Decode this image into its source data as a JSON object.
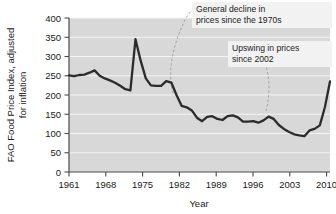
{
  "chart_data": {
    "type": "line",
    "title": "",
    "xlabel": "Year",
    "ylabel": "FAO Food Price Index, adjusted for inflation",
    "ylabel_line1": "FAO Food Price Index, adjusted",
    "ylabel_line2": "for inflation",
    "xlim": [
      1961,
      2012
    ],
    "ylim": [
      0,
      400
    ],
    "xticks": [
      1961,
      1968,
      1975,
      1982,
      1989,
      1996,
      2003,
      2010
    ],
    "xtick_labels": [
      "1961",
      "1968",
      "1975",
      "1982",
      "1989",
      "1996",
      "2003",
      "2010"
    ],
    "yticks": [
      0,
      50,
      100,
      150,
      200,
      250,
      300,
      350,
      400
    ],
    "ytick_labels": [
      "0",
      "50",
      "100",
      "150",
      "200",
      "250",
      "300",
      "350",
      "400"
    ],
    "grid": "horizontal",
    "legend": "none",
    "series": [
      {
        "name": "FAO Food Price Index (real)",
        "color": "#2b2b2b",
        "x": [
          1961,
          1962,
          1963,
          1964,
          1965,
          1966,
          1967,
          1968,
          1969,
          1970,
          1971,
          1972,
          1973,
          1974,
          1975,
          1976,
          1977,
          1978,
          1979,
          1980,
          1981,
          1982,
          1983,
          1984,
          1985,
          1986,
          1987,
          1988,
          1989,
          1990,
          1991,
          1992,
          1993,
          1994,
          1995,
          1996,
          1997,
          1998,
          1999,
          2000,
          2001,
          2002,
          2003,
          2004,
          2005,
          2006,
          2007,
          2008,
          2009,
          2010,
          2011,
          2012
        ],
        "values": [
          251,
          249,
          252,
          253,
          258,
          264,
          250,
          243,
          238,
          232,
          224,
          215,
          212,
          345,
          290,
          243,
          225,
          224,
          224,
          236,
          232,
          200,
          172,
          168,
          160,
          141,
          132,
          143,
          145,
          138,
          135,
          145,
          147,
          142,
          131,
          131,
          132,
          128,
          134,
          144,
          138,
          122,
          112,
          104,
          98,
          95,
          93,
          108,
          112,
          121,
          168,
          235
        ]
      }
    ],
    "annotations": [
      {
        "id": "general-decline",
        "line1": "General decline in",
        "line2": "prices since the 1970s"
      },
      {
        "id": "upswing",
        "line1": "Upswing in prices",
        "line2": "since 2002"
      }
    ],
    "colors": {
      "plot_background": "#d8d8d8",
      "gridline": "#f4f4f4",
      "series": "#2b2b2b",
      "axis": "#4a4a4a",
      "annotation_background": "#f2f2f2",
      "text": "#1a1a1a"
    }
  }
}
